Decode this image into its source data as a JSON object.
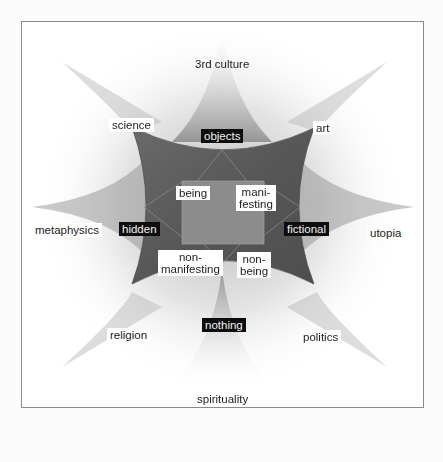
{
  "diagram": {
    "outer_labels": {
      "top": "3rd culture",
      "top_left": "science",
      "top_right": "art",
      "left": "metaphysics",
      "right": "utopia",
      "bottom_left": "religion",
      "bottom_right": "politics",
      "bottom": "spirituality"
    },
    "dark_labels": {
      "top": "objects",
      "left": "hidden",
      "right": "fictional",
      "bottom": "nothing"
    },
    "inner_labels": {
      "top_left": "being",
      "top_right_line1": "mani-",
      "top_right_line2": "festing",
      "bottom_left_line1": "non-",
      "bottom_left_line2": "manifesting",
      "bottom_right_line1": "non-",
      "bottom_right_line2": "being"
    },
    "colors": {
      "background": "#ffffff",
      "frame_border": "#8a8a8a",
      "curved_square": "#5e5e5e",
      "inner_square": "#8c8c8c",
      "star_shadow": "#9a9a9a",
      "dark_label_bg": "#0d0d0d",
      "light_label_bg": "#ffffff"
    }
  }
}
